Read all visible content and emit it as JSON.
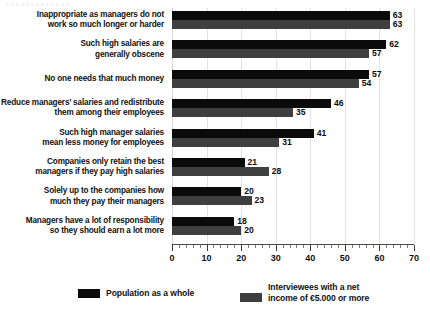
{
  "top_artifact": {
    "text": "a a     a a a a a a a      a a a a"
  },
  "chart_data": {
    "type": "bar",
    "orientation": "horizontal",
    "title": "",
    "subtitle": "",
    "xlabel": "",
    "ylabel": "",
    "xlim": [
      0,
      70
    ],
    "xticks": [
      0,
      10,
      20,
      30,
      40,
      50,
      60,
      70
    ],
    "xtick_labels": [
      "0",
      "10",
      "20",
      "30",
      "40",
      "50",
      "60",
      "70"
    ],
    "minor_tick_step": 2,
    "grid": "vertical",
    "legend_position": "bottom",
    "categories": [
      "Inappropriate as managers do not\nwork so much longer or harder",
      "Such high salaries are\ngenerally obscene",
      "No one needs that much money",
      "Reduce managers’ salaries and redistribute\nthem among their employees",
      "Such high manager salaries\nmean less money for employees",
      "Companies only retain the best\nmanagers if they pay high salaries",
      "Solely up to the companies how\nmuch they pay their managers",
      "Managers have a lot of responsibility\nso they should earn a lot more"
    ],
    "series": [
      {
        "name": "Population as a whole",
        "color": "#0b0b0b",
        "values": [
          63,
          62,
          57,
          46,
          41,
          21,
          20,
          18
        ]
      },
      {
        "name": "Interviewees with a net\nincome of €5.000 or more",
        "color": "#3f3f3f",
        "values": [
          63,
          57,
          54,
          35,
          31,
          28,
          23,
          20
        ]
      }
    ]
  },
  "legend": [
    {
      "label": "Population as a whole",
      "color": "#0b0b0b"
    },
    {
      "label": "Interviewees with a net\nincome of €5.000 or more",
      "color": "#3f3f3f"
    }
  ]
}
